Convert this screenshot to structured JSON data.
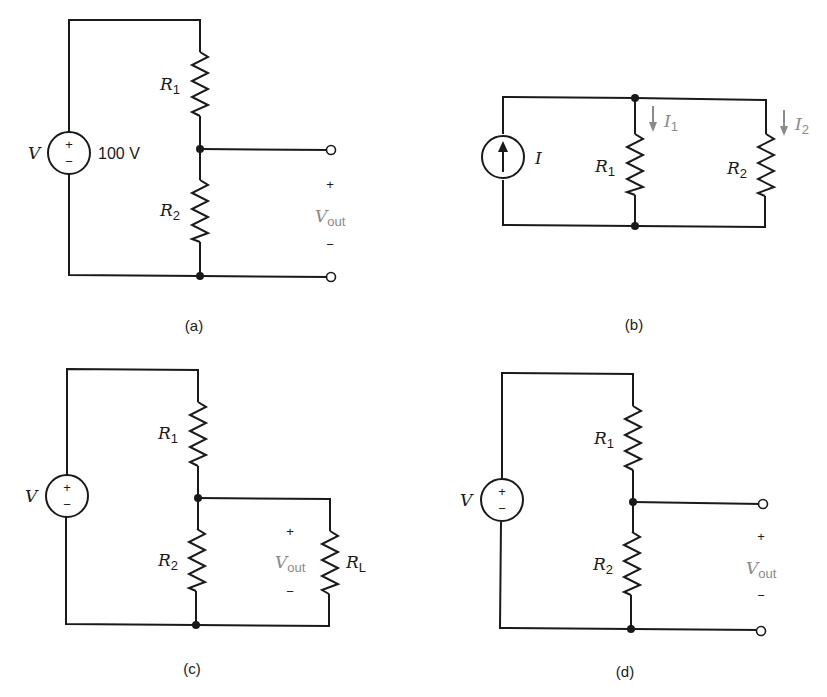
{
  "circuits": {
    "a": {
      "caption": "(a)",
      "source_label": "V",
      "source_value": "100 V",
      "source_plus": "+",
      "source_minus": "−",
      "r1_main": "R",
      "r1_sub": "1",
      "r2_main": "R",
      "r2_sub": "2",
      "out_plus": "+",
      "out_main": "V",
      "out_sub": "out",
      "out_minus": "−"
    },
    "b": {
      "caption": "(b)",
      "source_label": "I",
      "r1_main": "R",
      "r1_sub": "1",
      "r2_main": "R",
      "r2_sub": "2",
      "i1_main": "I",
      "i1_sub": "1",
      "i2_main": "I",
      "i2_sub": "2"
    },
    "c": {
      "caption": "(c)",
      "source_label": "V",
      "source_plus": "+",
      "source_minus": "−",
      "r1_main": "R",
      "r1_sub": "1",
      "r2_main": "R",
      "r2_sub": "2",
      "rl_main": "R",
      "rl_sub": "L",
      "out_plus": "+",
      "out_main": "V",
      "out_sub": "out",
      "out_minus": "−"
    },
    "d": {
      "caption": "(d)",
      "source_label": "V",
      "source_plus": "+",
      "source_minus": "−",
      "r1_main": "R",
      "r1_sub": "1",
      "r2_main": "R",
      "r2_sub": "2",
      "out_plus": "+",
      "out_main": "V",
      "out_sub": "out",
      "out_minus": "−"
    }
  },
  "colors": {
    "line": "#1a1a1a",
    "annotation": "#8a8a8a",
    "background": "#ffffff"
  }
}
